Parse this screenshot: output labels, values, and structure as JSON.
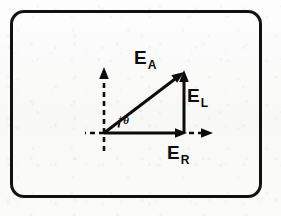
{
  "figure": {
    "type": "vector-diagram",
    "background_color": "#fbfbfa",
    "ink_color": "#0c0c0c",
    "frame": {
      "name": "rounded-rectangle-border",
      "stroke_color": "#111111",
      "stroke_width": 3,
      "corner_radius": 14,
      "x": 10,
      "y": 10,
      "width": 252,
      "height": 188
    },
    "origin": {
      "x": 104,
      "y": 133
    },
    "axes": {
      "style": "dashed",
      "vertical": {
        "name": "vertical-axis",
        "from": {
          "x": 104,
          "y": 150
        },
        "to": {
          "x": 104,
          "y": 74
        },
        "arrowhead": "top"
      },
      "horizontal_left_stub": {
        "name": "horizontal-axis-left-stub",
        "from": {
          "x": 104,
          "y": 133
        },
        "to": {
          "x": 86,
          "y": 133
        },
        "arrowhead": "none"
      },
      "horizontal_right": {
        "name": "horizontal-axis-right",
        "from": {
          "x": 188,
          "y": 133
        },
        "to": {
          "x": 210,
          "y": 133
        },
        "arrowhead": "right"
      }
    },
    "vectors": [
      {
        "id": "EA",
        "name": "vector-EA",
        "label_base": "E",
        "label_subscript": "A",
        "description": "resultant armature voltage vector",
        "from": {
          "x": 104,
          "y": 133
        },
        "to": {
          "x": 183,
          "y": 73
        },
        "style": "solid",
        "arrowhead": "end",
        "label_position": {
          "x": 134,
          "y": 48
        }
      },
      {
        "id": "EL",
        "name": "vector-EL",
        "label_base": "E",
        "label_subscript": "L",
        "description": "vertical leakage-reactance voltage component",
        "from": {
          "x": 184,
          "y": 133
        },
        "to": {
          "x": 184,
          "y": 74
        },
        "style": "solid",
        "arrowhead": "end",
        "label_position": {
          "x": 187,
          "y": 86
        }
      },
      {
        "id": "ER",
        "name": "vector-ER",
        "label_base": "E",
        "label_subscript": "R",
        "description": "horizontal resistive voltage component",
        "from": {
          "x": 104,
          "y": 133
        },
        "to": {
          "x": 186,
          "y": 133
        },
        "style": "solid",
        "arrowhead": "end",
        "label_position": {
          "x": 167,
          "y": 143
        }
      }
    ],
    "angle": {
      "name": "angle-theta",
      "label_plus": "+",
      "label_symbol": "θ",
      "between": [
        "ER",
        "EA"
      ],
      "arc_radius": 22,
      "arc_center": {
        "x": 104,
        "y": 133
      },
      "tick_mark": true,
      "label_position": {
        "x": 118,
        "y": 115
      }
    }
  }
}
